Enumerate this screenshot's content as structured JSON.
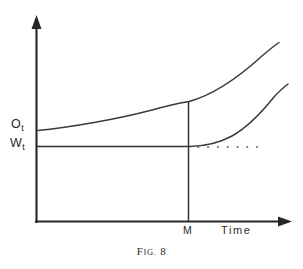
{
  "figure": {
    "caption_prefix": "F",
    "caption_smallcaps": "IG.",
    "caption_number": "8",
    "caption_full": "Fig. 8",
    "background_color": "#ffffff",
    "ink_color": "#2b2b2b"
  },
  "axes": {
    "y_axis_name": "value-axis",
    "x_axis_label": "Time",
    "x_tick_label": "M",
    "y_tick_labels": [
      {
        "variable": "O",
        "subscript": "t",
        "text": "Ot"
      },
      {
        "variable": "W",
        "subscript": "t",
        "text": "Wt"
      }
    ]
  },
  "chart_data": {
    "type": "line",
    "xlabel": "Time",
    "ylabel": "",
    "grid": false,
    "legend": "none",
    "xlim": [
      0,
      100
    ],
    "ylim": [
      0,
      100
    ],
    "annotations": [
      {
        "name": "Ot",
        "text": "Ot",
        "axis": "y",
        "value": 46,
        "note": "initial level of upper curve"
      },
      {
        "name": "Wt",
        "text": "Wt",
        "axis": "y",
        "value": 36,
        "note": "constant wage level"
      },
      {
        "name": "M",
        "text": "M",
        "axis": "x",
        "value": 60,
        "note": "vertical marker line at time M"
      }
    ],
    "series": [
      {
        "name": "upper-curve",
        "label": "Ot curve",
        "style": "solid",
        "x": [
          0,
          10,
          20,
          30,
          40,
          50,
          60,
          70,
          80,
          90,
          100
        ],
        "y": [
          46,
          47,
          49,
          52,
          56,
          61,
          59,
          67,
          76,
          86,
          98
        ],
        "points": [
          [
            0,
            46
          ],
          [
            15,
            48
          ],
          [
            30,
            52
          ],
          [
            45,
            58
          ],
          [
            60,
            59
          ],
          [
            75,
            72
          ],
          [
            90,
            88
          ],
          [
            100,
            98
          ]
        ]
      },
      {
        "name": "lower-curve",
        "label": "post-M rising curve",
        "style": "solid",
        "x": [
          60,
          68,
          76,
          84,
          92,
          100
        ],
        "y": [
          36,
          37,
          41,
          49,
          60,
          74
        ],
        "points": [
          [
            61,
            36
          ],
          [
            70,
            38
          ],
          [
            80,
            46
          ],
          [
            90,
            59
          ],
          [
            100,
            74
          ]
        ]
      },
      {
        "name": "wage-level-line",
        "label": "Wt horizontal line",
        "style": "solid",
        "x": [
          0,
          60
        ],
        "y": [
          36,
          36
        ]
      },
      {
        "name": "wage-level-extension",
        "label": "Wt dotted extension",
        "style": "dotted",
        "dot_count": 7,
        "x": [
          64,
          88
        ],
        "y": [
          36,
          36
        ]
      },
      {
        "name": "m-vertical-line",
        "label": "vertical line at M",
        "style": "solid",
        "x": [
          60,
          60
        ],
        "y": [
          0,
          59
        ]
      }
    ]
  }
}
